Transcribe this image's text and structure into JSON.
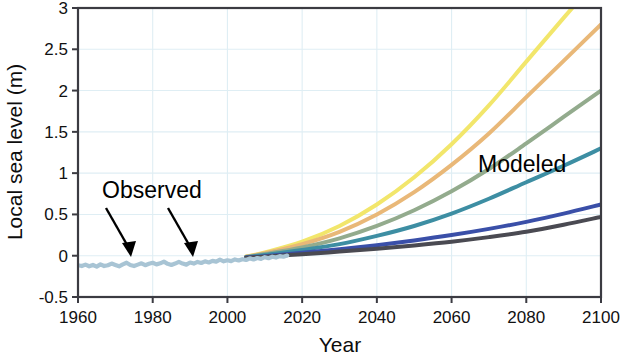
{
  "chart_data": {
    "type": "line",
    "title": "",
    "xlabel": "Year",
    "ylabel": "Local sea level (m)",
    "xlim": [
      1960,
      2100
    ],
    "ylim": [
      -0.5,
      3
    ],
    "xticks": [
      1960,
      1980,
      2000,
      2020,
      2040,
      2060,
      2080,
      2100
    ],
    "xtick_labels": [
      "1960",
      "1980",
      "2000",
      "2020",
      "2040",
      "2060",
      "2080",
      "2100"
    ],
    "yticks": [
      -0.5,
      0,
      0.5,
      1,
      1.5,
      2,
      2.5,
      3
    ],
    "ytick_labels": [
      "-0.5",
      "0",
      "0.5",
      "1",
      "1.5",
      "2",
      "2.5",
      "3"
    ],
    "grid": true,
    "legend": "none",
    "annotations": [
      {
        "text": "Observed",
        "x_px": 102,
        "y_px": 190
      },
      {
        "text": "Modeled",
        "x_px": 478,
        "y_px": 164
      }
    ],
    "observed": {
      "name": "Observed",
      "color": "#a8c4d4",
      "linewidth": 4.2,
      "x": [
        1960,
        1961,
        1962,
        1963,
        1964,
        1965,
        1966,
        1967,
        1968,
        1969,
        1970,
        1971,
        1972,
        1973,
        1974,
        1975,
        1976,
        1977,
        1978,
        1979,
        1980,
        1981,
        1982,
        1983,
        1984,
        1985,
        1986,
        1987,
        1988,
        1989,
        1990,
        1991,
        1992,
        1993,
        1994,
        1995,
        1996,
        1997,
        1998,
        1999,
        2000,
        2001,
        2002,
        2003,
        2004,
        2005,
        2006,
        2007,
        2008,
        2009,
        2010,
        2011,
        2012,
        2013,
        2014,
        2015,
        2016
      ],
      "y": [
        -0.115,
        -0.125,
        -0.108,
        -0.128,
        -0.112,
        -0.132,
        -0.105,
        -0.125,
        -0.115,
        -0.095,
        -0.112,
        -0.128,
        -0.105,
        -0.085,
        -0.112,
        -0.125,
        -0.108,
        -0.092,
        -0.115,
        -0.098,
        -0.085,
        -0.105,
        -0.092,
        -0.072,
        -0.098,
        -0.112,
        -0.095,
        -0.075,
        -0.095,
        -0.108,
        -0.082,
        -0.095,
        -0.075,
        -0.088,
        -0.068,
        -0.082,
        -0.062,
        -0.072,
        -0.048,
        -0.068,
        -0.055,
        -0.065,
        -0.045,
        -0.058,
        -0.042,
        -0.052,
        -0.032,
        -0.045,
        -0.028,
        -0.038,
        -0.018,
        -0.03,
        -0.012,
        -0.022,
        -0.005,
        -0.012,
        0.002
      ]
    },
    "series": [
      {
        "name": "Highest scenario",
        "color": "#f2e66b",
        "linewidth": 4.0,
        "value_2100": 3.4,
        "x": [
          2005,
          2010,
          2020,
          2030,
          2040,
          2050,
          2060,
          2070,
          2080,
          2090,
          2100
        ],
        "y": [
          -0.01,
          0.04,
          0.17,
          0.36,
          0.62,
          0.95,
          1.35,
          1.82,
          2.35,
          2.88,
          3.4
        ]
      },
      {
        "name": "High scenario",
        "color": "#e9b878",
        "linewidth": 4.0,
        "value_2100": 2.8,
        "x": [
          2005,
          2010,
          2020,
          2030,
          2040,
          2050,
          2060,
          2070,
          2080,
          2090,
          2100
        ],
        "y": [
          -0.012,
          0.03,
          0.14,
          0.29,
          0.5,
          0.77,
          1.1,
          1.48,
          1.92,
          2.36,
          2.8
        ]
      },
      {
        "name": "Intermediate-high scenario",
        "color": "#93ab8d",
        "linewidth": 4.0,
        "value_2100": 2.0,
        "x": [
          2005,
          2010,
          2020,
          2030,
          2040,
          2050,
          2060,
          2070,
          2080,
          2090,
          2100
        ],
        "y": [
          -0.015,
          0.02,
          0.1,
          0.21,
          0.36,
          0.55,
          0.78,
          1.05,
          1.36,
          1.68,
          2.0
        ]
      },
      {
        "name": "Intermediate scenario",
        "color": "#3d8ea3",
        "linewidth": 4.0,
        "value_2100": 1.3,
        "x": [
          2005,
          2010,
          2020,
          2030,
          2040,
          2050,
          2060,
          2070,
          2080,
          2090,
          2100
        ],
        "y": [
          -0.018,
          0.01,
          0.07,
          0.14,
          0.24,
          0.36,
          0.51,
          0.69,
          0.89,
          1.09,
          1.3
        ]
      },
      {
        "name": "Intermediate-low scenario",
        "color": "#3a4fa8",
        "linewidth": 4.0,
        "value_2100": 0.62,
        "x": [
          2005,
          2010,
          2020,
          2030,
          2040,
          2050,
          2060,
          2070,
          2080,
          2090,
          2100
        ],
        "y": [
          -0.022,
          -0.005,
          0.035,
          0.078,
          0.128,
          0.185,
          0.25,
          0.325,
          0.41,
          0.51,
          0.62
        ]
      },
      {
        "name": "Low scenario",
        "color": "#4a4a52",
        "linewidth": 4.0,
        "value_2100": 0.47,
        "x": [
          2005,
          2010,
          2020,
          2030,
          2040,
          2050,
          2060,
          2070,
          2080,
          2090,
          2100
        ],
        "y": [
          -0.025,
          -0.012,
          0.018,
          0.05,
          0.085,
          0.125,
          0.17,
          0.225,
          0.29,
          0.375,
          0.47
        ]
      }
    ]
  },
  "axis": {
    "x_title": "Year",
    "y_title": "Local sea level (m)"
  },
  "labels": {
    "observed": "Observed",
    "modeled": "Modeled"
  }
}
